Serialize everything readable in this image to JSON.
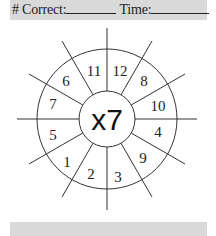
{
  "header": {
    "correct_label": "# Correct:",
    "time_label": "Time:"
  },
  "wheel": {
    "center_label": "x7",
    "sectors": [
      "12",
      "8",
      "10",
      "4",
      "9",
      "3",
      "2",
      "1",
      "5",
      "7",
      "6",
      "11"
    ]
  },
  "colors": {
    "bar": "#d9d9d9",
    "ink": "#222222"
  }
}
